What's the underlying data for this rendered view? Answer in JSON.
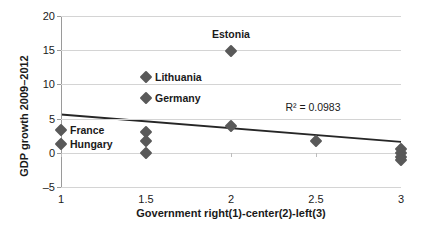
{
  "chart_data": {
    "type": "scatter",
    "title": "",
    "xlabel": "Government right(1)-center(2)-left(3)",
    "ylabel": "GDP growth 2009–2012",
    "xlim": [
      1,
      3
    ],
    "ylim": [
      -5,
      20
    ],
    "xticks": [
      "1",
      "1.5",
      "2",
      "2.5",
      "3"
    ],
    "xtick_values": [
      1,
      1.5,
      2,
      2.5,
      3
    ],
    "yticks": [
      "20",
      "15",
      "10",
      "5",
      "0",
      "–5"
    ],
    "ytick_values": [
      20,
      15,
      10,
      5,
      0,
      -5
    ],
    "grid": true,
    "legend": "none",
    "marker_color": "#595959",
    "gridline_color": "#d4d4d4",
    "trendline_color": "#262626",
    "points": [
      {
        "x": 1,
        "y": 3.4,
        "label": "France",
        "label_pos": "right"
      },
      {
        "x": 1,
        "y": 1.3,
        "label": "Hungary",
        "label_pos": "right"
      },
      {
        "x": 1.5,
        "y": 11.1,
        "label": "Lithuania",
        "label_pos": "right"
      },
      {
        "x": 1.5,
        "y": 8.0,
        "label": "Germany",
        "label_pos": "right"
      },
      {
        "x": 1.5,
        "y": 3.0,
        "label": "",
        "label_pos": ""
      },
      {
        "x": 1.5,
        "y": 1.7,
        "label": "",
        "label_pos": ""
      },
      {
        "x": 1.5,
        "y": -0.1,
        "label": "",
        "label_pos": ""
      },
      {
        "x": 2,
        "y": 14.9,
        "label": "Estonia",
        "label_pos": "above"
      },
      {
        "x": 2,
        "y": 3.9,
        "label": "",
        "label_pos": ""
      },
      {
        "x": 2.5,
        "y": 1.7,
        "label": "",
        "label_pos": ""
      },
      {
        "x": 3,
        "y": 0.6,
        "label": "",
        "label_pos": ""
      },
      {
        "x": 3,
        "y": -0.1,
        "label": "",
        "label_pos": ""
      },
      {
        "x": 3,
        "y": -0.6,
        "label": "",
        "label_pos": ""
      },
      {
        "x": 3,
        "y": -1.0,
        "label": "",
        "label_pos": ""
      }
    ],
    "trendline": {
      "x0": 1,
      "y0": 5.6,
      "x1": 3,
      "y1": 1.6
    },
    "annotations": [
      {
        "text": "R² = 0.0983",
        "x": 2.32,
        "y": 7.6
      }
    ]
  }
}
